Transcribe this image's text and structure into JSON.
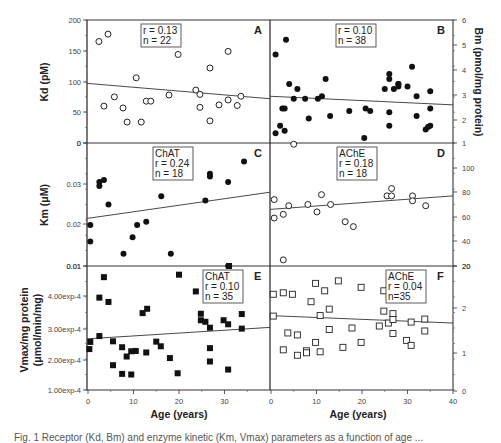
{
  "chart_data": [
    {
      "panel": "A",
      "type": "scatter",
      "ylabel": "Kd (pM)",
      "xlabel": "",
      "ylim": [
        0,
        200
      ],
      "xlim": [
        0,
        40
      ],
      "yticks": [
        "0",
        "50",
        "100",
        "150",
        "200"
      ],
      "marker": "open-circle",
      "annotation": [
        "r = 0.13",
        "n = 22"
      ],
      "regression": [
        [
          0,
          97
        ],
        [
          40,
          72
        ]
      ],
      "points": [
        [
          2.4,
          165
        ],
        [
          4.4,
          177
        ],
        [
          3.5,
          60
        ],
        [
          5.8,
          75
        ],
        [
          7.7,
          57
        ],
        [
          8.6,
          34
        ],
        [
          10.6,
          106
        ],
        [
          11.7,
          34
        ],
        [
          12.8,
          68
        ],
        [
          13.8,
          68
        ],
        [
          17.8,
          78
        ],
        [
          19.8,
          144
        ],
        [
          23.7,
          86
        ],
        [
          24.6,
          79
        ],
        [
          24.6,
          58
        ],
        [
          26.8,
          122
        ],
        [
          26.8,
          36
        ],
        [
          28.8,
          62
        ],
        [
          30.8,
          149
        ],
        [
          30.8,
          70
        ],
        [
          32.8,
          61
        ],
        [
          33.6,
          76
        ]
      ]
    },
    {
      "panel": "B",
      "type": "scatter",
      "ylabel": "Bm (pmol/mg protein)",
      "ylim": [
        1,
        6
      ],
      "xlim": [
        0,
        40
      ],
      "yticks": [
        "1",
        "2",
        "3",
        "4",
        "5",
        "6"
      ],
      "marker": "filled-circle",
      "annotation": [
        "r = 0.10",
        "n = 38"
      ],
      "regression": [
        [
          0,
          2.9
        ],
        [
          40,
          2.55
        ]
      ],
      "points": [
        [
          1,
          4.6
        ],
        [
          1,
          1.4
        ],
        [
          2,
          1.7
        ],
        [
          2.5,
          2.4
        ],
        [
          3,
          2.4
        ],
        [
          3,
          1.5
        ],
        [
          3.3,
          5.2
        ],
        [
          4,
          3.4
        ],
        [
          5,
          2.8
        ],
        [
          5.8,
          3.2
        ],
        [
          7.5,
          2.8
        ],
        [
          8.3,
          2.0
        ],
        [
          10.3,
          2.8
        ],
        [
          11.2,
          2.9
        ],
        [
          12,
          3.6
        ],
        [
          13,
          2.1
        ],
        [
          17.2,
          2.3
        ],
        [
          20.5,
          1.2
        ],
        [
          20.8,
          2.4
        ],
        [
          21.8,
          2.3
        ],
        [
          25,
          3.2
        ],
        [
          26,
          3.8
        ],
        [
          26,
          3.6
        ],
        [
          26,
          2.25
        ],
        [
          26,
          1.7
        ],
        [
          27,
          3.2
        ],
        [
          28,
          3.3
        ],
        [
          28,
          3.4
        ],
        [
          28,
          3.4
        ],
        [
          30,
          3.3
        ],
        [
          31,
          4.1
        ],
        [
          32,
          2.1
        ],
        [
          32,
          2.9
        ],
        [
          34,
          1.55
        ],
        [
          35,
          3.1
        ],
        [
          35,
          2.4
        ],
        [
          35,
          1.7
        ],
        [
          34.5,
          1.65
        ]
      ]
    },
    {
      "panel": "C",
      "type": "scatter",
      "ylabel": "Km (μM)",
      "ylim": [
        0.01,
        0.04
      ],
      "xlim": [
        0,
        40
      ],
      "yticks": [
        "0.01",
        "0.02",
        "0.03",
        "0"
      ],
      "marker": "filled-circle",
      "annotation": [
        "ChAT",
        "r = 0.24",
        "n = 18"
      ],
      "regression": [
        [
          0,
          0.0216
        ],
        [
          40,
          0.028
        ]
      ],
      "points": [
        [
          0.5,
          0.02
        ],
        [
          0.5,
          0.016
        ],
        [
          2.5,
          0.0305
        ],
        [
          2.5,
          0.0295
        ],
        [
          3.5,
          0.031
        ],
        [
          4.5,
          0.025
        ],
        [
          7.8,
          0.013
        ],
        [
          9.8,
          0.017
        ],
        [
          10.8,
          0.02
        ],
        [
          12.8,
          0.0208
        ],
        [
          16.1,
          0.027
        ],
        [
          18.2,
          0.013
        ],
        [
          25.8,
          0.026
        ],
        [
          26.8,
          0.0325
        ],
        [
          26.8,
          0.0318
        ],
        [
          30.8,
          0.0305
        ],
        [
          30.8,
          0.01
        ],
        [
          34.3,
          0.0355
        ]
      ]
    },
    {
      "panel": "D",
      "type": "scatter",
      "ylabel": "",
      "ylim": [
        20,
        120
      ],
      "xlim": [
        0,
        40
      ],
      "yticks": [
        "20",
        "40",
        "60",
        "80",
        "100"
      ],
      "marker": "open-circle",
      "annotation": [
        "AChE",
        "r = 0.18",
        "n = 18"
      ],
      "regression": [
        [
          0,
          66
        ],
        [
          40,
          77
        ]
      ],
      "points": [
        [
          0.7,
          74
        ],
        [
          0.7,
          59
        ],
        [
          2.7,
          62
        ],
        [
          2.7,
          25
        ],
        [
          3.9,
          69
        ],
        [
          8.1,
          70
        ],
        [
          10.1,
          64
        ],
        [
          11.1,
          78
        ],
        [
          13.1,
          70
        ],
        [
          16.3,
          56
        ],
        [
          18.1,
          52
        ],
        [
          25.5,
          77
        ],
        [
          26.5,
          77
        ],
        [
          26.5,
          83
        ],
        [
          31.1,
          77
        ],
        [
          31.1,
          73
        ],
        [
          34,
          69
        ],
        [
          5,
          119
        ]
      ]
    },
    {
      "panel": "E",
      "type": "scatter",
      "ylabel": "Vmax/mg protein (μmol/min/mg)",
      "xlabel": "Age (years)",
      "ylim": [
        0.0001,
        0.0005
      ],
      "xlim": [
        0,
        40
      ],
      "xticks": [
        "0",
        "10",
        "20",
        "30"
      ],
      "yticks": [
        "1.00exp-4",
        "2.00exp-4",
        "3.00exp-4",
        "4.00exp-4",
        "0.01"
      ],
      "marker": "filled-square",
      "annotation": [
        "ChAT",
        "r = 0.10",
        "n = 35"
      ],
      "regression": [
        [
          0,
          0.000265
        ],
        [
          40,
          0.000302
        ]
      ],
      "points": [
        [
          0.3,
          0.000232
        ],
        [
          0.5,
          0.000255
        ],
        [
          2.5,
          0.000398
        ],
        [
          2.5,
          0.000274
        ],
        [
          3.5,
          0.000464
        ],
        [
          4.5,
          0.000384
        ],
        [
          5.5,
          0.000257
        ],
        [
          5.5,
          0.00018
        ],
        [
          7.5,
          0.000238
        ],
        [
          7.5,
          0.000152
        ],
        [
          8.5,
          0.000208
        ],
        [
          9.5,
          0.000225
        ],
        [
          9.5,
          0.00015
        ],
        [
          10.5,
          0.000226
        ],
        [
          12,
          0.000348
        ],
        [
          12.8,
          0.000221
        ],
        [
          13,
          0.000362
        ],
        [
          15,
          0.000256
        ],
        [
          16,
          0.000241
        ],
        [
          18,
          0.000203
        ],
        [
          19.7,
          0.000154
        ],
        [
          20,
          0.000472
        ],
        [
          23.7,
          0.000418
        ],
        [
          24.8,
          0.000346
        ],
        [
          24.8,
          0.000325
        ],
        [
          25.8,
          0.00032
        ],
        [
          26.8,
          0.000301
        ],
        [
          26.8,
          0.000235
        ],
        [
          26.8,
          0.000192
        ],
        [
          29.8,
          0.000325
        ],
        [
          30.8,
          0.000312
        ],
        [
          30.8,
          0.000166
        ],
        [
          33.8,
          0.000345
        ],
        [
          33.8,
          0.000298
        ],
        [
          31,
          0.0005
        ]
      ]
    },
    {
      "panel": "F",
      "type": "scatter",
      "ylabel": "",
      "xlabel": "Age (years)",
      "ylim": [
        0,
        2.5
      ],
      "xlim": [
        0,
        40
      ],
      "xticks": [
        "0",
        "10",
        "20",
        "30",
        "40"
      ],
      "yticks": [
        "0",
        "1",
        "2",
        "20"
      ],
      "marker": "open-square",
      "annotation": [
        "AChE",
        "r = 0.04",
        "n=35"
      ],
      "regression": [
        [
          0,
          1.5
        ],
        [
          40,
          1.35
        ]
      ],
      "points": [
        [
          0.5,
          1.93
        ],
        [
          0.5,
          1.49
        ],
        [
          2.7,
          1.96
        ],
        [
          2.7,
          0.81
        ],
        [
          3.7,
          1.15
        ],
        [
          4.7,
          1.93
        ],
        [
          5.8,
          1.11
        ],
        [
          5.8,
          0.7
        ],
        [
          7.8,
          0.79
        ],
        [
          7.8,
          0.75
        ],
        [
          8.8,
          1.78
        ],
        [
          9.8,
          2.15
        ],
        [
          9.8,
          0.96
        ],
        [
          10.8,
          1.5
        ],
        [
          10.8,
          0.77
        ],
        [
          11.8,
          2.0
        ],
        [
          12.8,
          1.63
        ],
        [
          12.8,
          1.22
        ],
        [
          14.8,
          2.2
        ],
        [
          15.8,
          0.86
        ],
        [
          17.8,
          1.25
        ],
        [
          19.8,
          2.07
        ],
        [
          19.8,
          0.96
        ],
        [
          23.8,
          1.29
        ],
        [
          24.8,
          2.0
        ],
        [
          24.8,
          1.59
        ],
        [
          25.8,
          1.35
        ],
        [
          26.8,
          1.54
        ],
        [
          26.8,
          1.42
        ],
        [
          26.8,
          1.14
        ],
        [
          29.8,
          1.0
        ],
        [
          30.8,
          1.37
        ],
        [
          30.8,
          0.9
        ],
        [
          33.8,
          1.43
        ],
        [
          33.8,
          1.19
        ]
      ]
    }
  ],
  "labels": {
    "kd": "Kd (pM)",
    "bm": "Bm (pmol/mg protein)",
    "km": "Km (μM)",
    "vmax1": "Vmax/mg protein",
    "vmax2": "(μmol/min/mg)",
    "xlabel_left": "Age (years)",
    "xlabel_right": "Age (years)"
  },
  "caption": "Fig. 1 Receptor (Kd, Bm) and enzyme kinetic (Km, Vmax) parameters as a function of age ..."
}
